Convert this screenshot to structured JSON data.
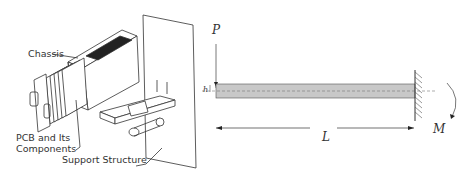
{
  "left_figure": {
    "labels": {
      "chassis": "Chassis",
      "pcb_line1": "PCB and Its",
      "pcb_line2": "Components",
      "support": "Support Structure"
    }
  },
  "right_figure": {
    "labels": {
      "load": "P",
      "thickness": "h",
      "length": "L",
      "moment": "M"
    },
    "colors": {
      "beam_fill": "#c8c8c8",
      "line": "#333333"
    }
  }
}
